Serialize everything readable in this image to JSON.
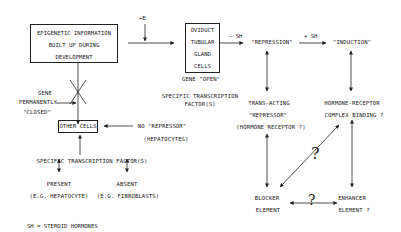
{
  "diagram": {
    "boxes": {
      "epigenetic": [
        "EPIGENETIC INFORMATION",
        "BUILT UP DURING",
        "DEVELOPMENT"
      ],
      "oviduct": [
        "OVIDUCT",
        "TUBULAR",
        "GLAND",
        "CELLS"
      ],
      "other_cells": "OTHER CELLS"
    },
    "labels": {
      "plus_e": "+E",
      "minus_sh": "− SH",
      "plus_sh": "+ SH",
      "repression": "\"REPRESSION\"",
      "induction": "\"INDUCTION\"",
      "gene_open": "GENE \"OPEN\"",
      "specific_tf_top": [
        "SPECIFIC TRANSCRIPTION",
        "FACTOR(S)"
      ],
      "gene_closed": [
        "GENE",
        "PERMANENTLY",
        "\"CLOSED\""
      ],
      "no_repressor": [
        "NO \"REPRESSOR\"",
        "(HEPATOCYTES)"
      ],
      "trans_acting": [
        "TRANS-ACTING",
        "\"REPRESSOR\"",
        "(HORMONE RECEPTOR ?)"
      ],
      "hormone_receptor": [
        "HORMONE-RECEPTOR",
        "COMPLEX BINDING ?"
      ],
      "specific_tf_bottom": "SPECIFIC TRANSCRIPTION FACTOR(S)",
      "present": "PRESENT",
      "absent": "ABSENT",
      "present_example": "(E.G. HEPATOCYTE)",
      "absent_example": "(E.G. FIBROBLASTS)",
      "blocker": [
        "BLOCKER",
        "ELEMENT"
      ],
      "enhancer": [
        "ENHANCER",
        "ELEMENT ?"
      ],
      "question_mark": "?",
      "footnote": "SH = STEROID HORMONES"
    },
    "colors": {
      "ink": "#222222",
      "background": "#ffffff"
    }
  }
}
